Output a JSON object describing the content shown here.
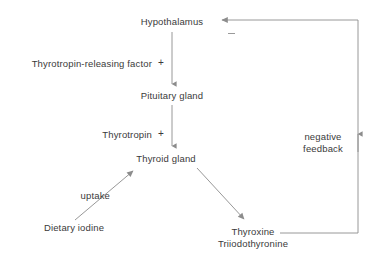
{
  "diagram": {
    "stroke_color": "#8c8c8c",
    "text_color": "#3a3a3a",
    "background_color": "#ffffff",
    "nodes": [
      {
        "id": "hypothalamus",
        "label": "Hypothalamus"
      },
      {
        "id": "pituitary",
        "label": "Pituitary gland"
      },
      {
        "id": "thyroid",
        "label": "Thyroid gland"
      },
      {
        "id": "dietary_iodine",
        "label": "Dietary iodine"
      },
      {
        "id": "thyroxine",
        "label": "Thyroxine"
      },
      {
        "id": "triiodothyronine",
        "label": "Triiodothyronine"
      }
    ],
    "edge_labels": [
      {
        "id": "trf",
        "label": "Thyrotropin-releasing factor",
        "sign": "+"
      },
      {
        "id": "tsh",
        "label": "Thyrotropin",
        "sign": "+"
      },
      {
        "id": "uptake",
        "label": "uptake"
      }
    ],
    "feedback": {
      "line1": "negative",
      "line2": "feedback",
      "sign": "−"
    }
  }
}
